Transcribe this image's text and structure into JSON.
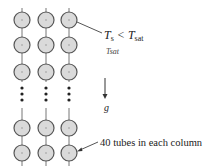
{
  "figure": {
    "columns": 3,
    "column_x": [
      22,
      46,
      69
    ],
    "visible_rows_top_y": [
      20,
      45,
      72
    ],
    "visible_rows_bottom_y": [
      128,
      153
    ],
    "ellipsis_dot_y": [
      88,
      94,
      100
    ],
    "tube_radius": 8,
    "colors": {
      "tube_fill": "#d9d9d9",
      "tube_stroke": "#555555",
      "line": "#666666",
      "text": "#222222"
    }
  },
  "labels": {
    "surface_temp_T": "T",
    "surface_temp_sub": "s",
    "less_than": " < ",
    "sat_T": "T",
    "sat_sub": "sat",
    "tsat_small": "Tsat",
    "gravity": "g",
    "tube_count": "40 tubes in each column"
  }
}
